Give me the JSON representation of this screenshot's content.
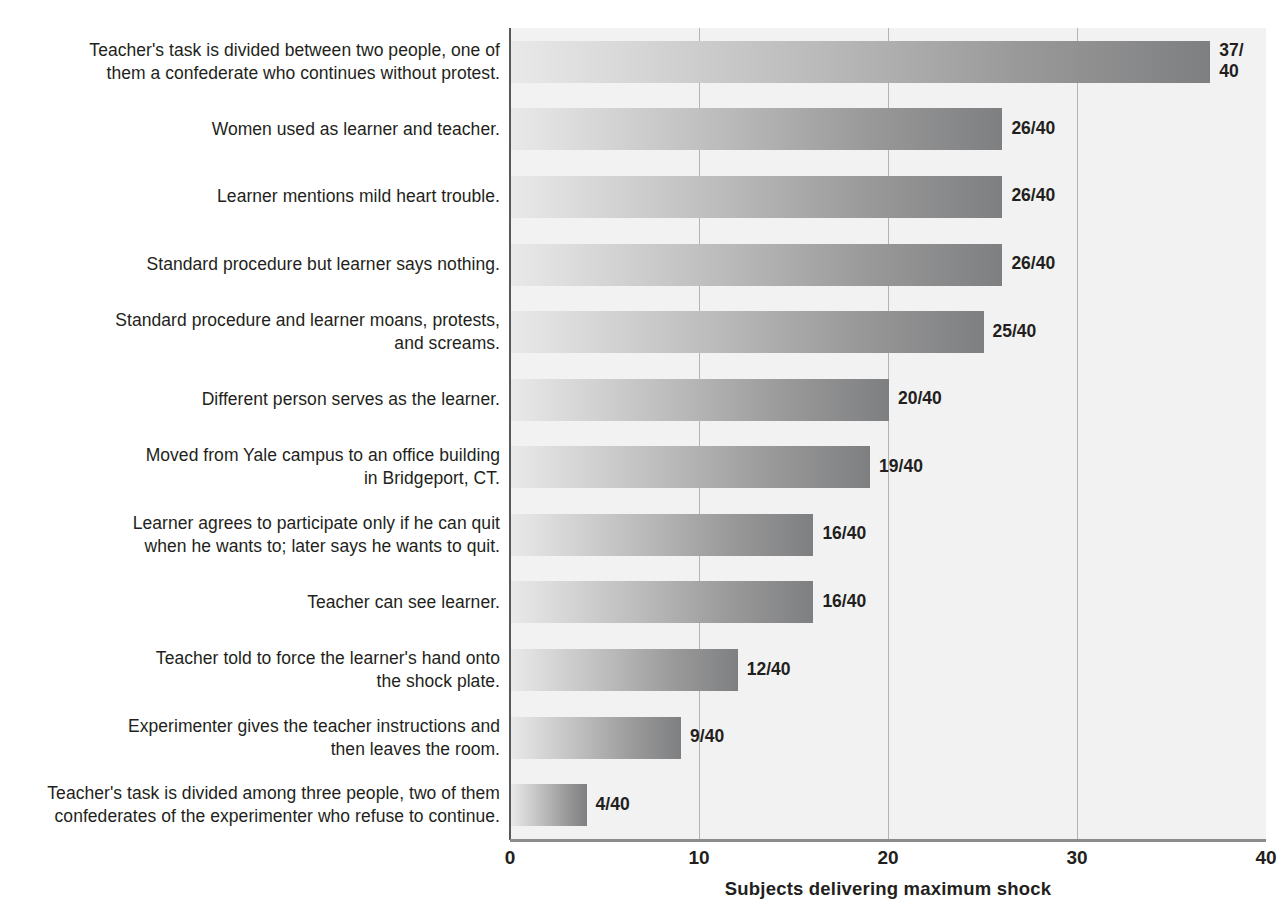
{
  "chart_data": {
    "type": "bar",
    "orientation": "horizontal",
    "title": "",
    "xlabel": "Subjects delivering maximum shock",
    "ylabel": "",
    "xlim": [
      0,
      40
    ],
    "xticks": [
      "0",
      "10",
      "20",
      "30",
      "40"
    ],
    "xtick_values": [
      0,
      10,
      20,
      30,
      40
    ],
    "gridlines": [
      10,
      20,
      30
    ],
    "grid": true,
    "legend": "none",
    "denominator": 40,
    "categories": [
      "Teacher's task is divided between two people, one of\nthem a confederate who continues without protest.",
      "Women used as learner and teacher.",
      "Learner mentions mild heart trouble.",
      "Standard procedure but learner says nothing.",
      "Standard procedure and learner moans, protests,\nand screams.",
      "Different person serves as the learner.",
      "Moved from Yale campus to an office building\nin Bridgeport, CT.",
      "Learner agrees to participate only if he can quit\nwhen he wants to; later says he wants to quit.",
      "Teacher can see learner.",
      "Teacher told to force the learner's hand onto\nthe shock plate.",
      "Experimenter gives the teacher instructions and\nthen leaves the room.",
      "Teacher's task is divided among three people, two of them\nconfederates of the experimenter who refuse to continue."
    ],
    "values": [
      37,
      26,
      26,
      26,
      25,
      20,
      19,
      16,
      16,
      12,
      9,
      4
    ],
    "value_labels": [
      "37/\n40",
      "26/40",
      "26/40",
      "26/40",
      "25/40",
      "20/40",
      "19/40",
      "16/40",
      "16/40",
      "12/40",
      "9/40",
      "4/40"
    ]
  },
  "colors": {
    "plot_background": "#f2f2f2",
    "bar_gradient_start": "#e9e9e9",
    "bar_gradient_end": "#7e7f81",
    "axis": "#58595b",
    "gridline": "#b3b3b3",
    "text": "#231f20",
    "page_background": "#ffffff"
  }
}
